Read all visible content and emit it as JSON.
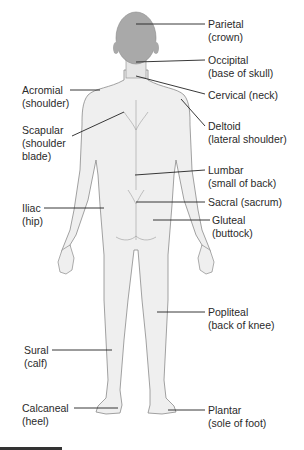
{
  "diagram": {
    "colors": {
      "head": "#a9a9a9",
      "body_fill": "#efefef",
      "outline": "#8a8a8a",
      "leader": "#222222",
      "text": "#2a2a2a"
    },
    "labels": [
      {
        "id": "parietal",
        "term": "Parietal",
        "common": "(crown)",
        "side": "right"
      },
      {
        "id": "occipital",
        "term": "Occipital",
        "common": "(base of skull)",
        "side": "right"
      },
      {
        "id": "cervical",
        "term": "Cervical (neck)",
        "common": "",
        "side": "right"
      },
      {
        "id": "deltoid",
        "term": "Deltoid",
        "common": "(lateral shoulder)",
        "side": "right"
      },
      {
        "id": "lumbar",
        "term": "Lumbar",
        "common": "(small of back)",
        "side": "right"
      },
      {
        "id": "sacral",
        "term": "Sacral (sacrum)",
        "common": "",
        "side": "right"
      },
      {
        "id": "gluteal",
        "term": "Gluteal",
        "common": "(buttock)",
        "side": "right"
      },
      {
        "id": "popliteal",
        "term": "Popliteal",
        "common": "(back of knee)",
        "side": "right"
      },
      {
        "id": "plantar",
        "term": "Plantar",
        "common": "(sole of foot)",
        "side": "right"
      },
      {
        "id": "acromial",
        "term": "Acromial",
        "common": "(shoulder)",
        "side": "left"
      },
      {
        "id": "scapular",
        "term": "Scapular",
        "common": "(shoulder",
        "common2": "blade)",
        "side": "left"
      },
      {
        "id": "iliac",
        "term": "Iliac",
        "common": "(hip)",
        "side": "left"
      },
      {
        "id": "sural",
        "term": "Sural",
        "common": "(calf)",
        "side": "left"
      },
      {
        "id": "calcaneal",
        "term": "Calcaneal",
        "common": "(heel)",
        "side": "left"
      }
    ]
  }
}
